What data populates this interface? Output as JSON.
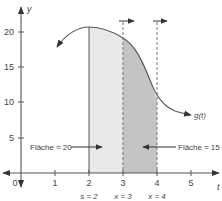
{
  "diagram": {
    "axes": {
      "x_label": "t",
      "y_label": "y",
      "origin_label": "0",
      "x_ticks": [
        "1",
        "2",
        "3",
        "4",
        "5"
      ],
      "y_ticks": [
        "20",
        "15",
        "10",
        "5"
      ]
    },
    "curve_label": "g(t)",
    "area_left_label": "Fläche ≈ 20",
    "area_right_label": "Fläche ≈ 15",
    "markers": {
      "s": "s = 2",
      "x1": "x = 3",
      "x2": "x = 4"
    },
    "colors": {
      "axis": "#555555",
      "curve": "#555555",
      "region_light": "#e8e8e8",
      "region_dark": "#c4c4c4",
      "text": "#444444"
    }
  }
}
